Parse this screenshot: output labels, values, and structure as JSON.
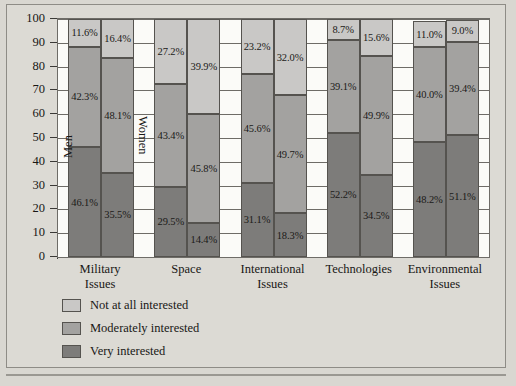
{
  "chart_data": {
    "type": "bar",
    "title": "",
    "subtitle": "",
    "xlabel": "",
    "ylabel": "",
    "ylim": [
      0,
      100
    ],
    "yticks": [
      0,
      10,
      20,
      30,
      40,
      50,
      60,
      70,
      80,
      90,
      100
    ],
    "grid": true,
    "stacked": true,
    "legend_position": "bottom-left",
    "categories": [
      "Military Issues",
      "Space",
      "International Issues",
      "Technologies",
      "Environmental Issues"
    ],
    "category_lines": [
      [
        "Military",
        "Issues"
      ],
      [
        "Space",
        ""
      ],
      [
        "International",
        "Issues"
      ],
      [
        "Technologies",
        ""
      ],
      [
        "Environmental",
        "Issues"
      ]
    ],
    "group_labels": [
      "Men",
      "Women"
    ],
    "stack_order_bottom_to_top": [
      "Very interested",
      "Moderately interested",
      "Not at all interested"
    ],
    "legend": [
      {
        "label": "Not at all interested",
        "color": "#c9c8c6"
      },
      {
        "label": "Moderately interested",
        "color": "#a3a2a0"
      },
      {
        "label": "Very interested",
        "color": "#7d7c7a"
      }
    ],
    "series": [
      {
        "name": "Very interested",
        "color": "#7d7c7a",
        "men": [
          46.1,
          29.5,
          31.1,
          52.2,
          48.2
        ],
        "women": [
          35.5,
          14.4,
          18.3,
          34.5,
          51.1
        ]
      },
      {
        "name": "Moderately interested",
        "color": "#a3a2a0",
        "men": [
          42.3,
          43.4,
          45.6,
          39.1,
          40.0
        ],
        "women": [
          48.1,
          45.8,
          49.7,
          49.9,
          39.4
        ]
      },
      {
        "name": "Not at all interested",
        "color": "#c9c8c6",
        "men": [
          11.6,
          27.2,
          23.2,
          8.7,
          11.0
        ],
        "women": [
          16.4,
          39.9,
          32.0,
          15.6,
          9.0
        ]
      }
    ],
    "data_labels": {
      "Military Issues": {
        "Men": {
          "Very interested": "46.1%",
          "Moderately interested": "42.3%",
          "Not at all interested": "11.6%"
        },
        "Women": {
          "Very interested": "35.5%",
          "Moderately interested": "48.1%",
          "Not at all interested": "16.4%"
        }
      },
      "Space": {
        "Men": {
          "Very interested": "29.5%",
          "Moderately interested": "43.4%",
          "Not at all interested": "27.2%"
        },
        "Women": {
          "Very interested": "14.4%",
          "Moderately interested": "45.8%",
          "Not at all interested": "39.9%"
        }
      },
      "International Issues": {
        "Men": {
          "Very interested": "31.1%",
          "Moderately interested": "45.6%",
          "Not at all interested": "23.2%"
        },
        "Women": {
          "Very interested": "18.3%",
          "Moderately interested": "49.7%",
          "Not at all interested": "32.0%"
        }
      },
      "Technologies": {
        "Men": {
          "Very interested": "52.2%",
          "Moderately interested": "39.1%",
          "Not at all interested": "8.7%"
        },
        "Women": {
          "Very interested": "34.5%",
          "Moderately interested": "49.9%",
          "Not at all interested": "15.6%"
        }
      },
      "Environmental Issues": {
        "Men": {
          "Very interested": "48.2%",
          "Moderately interested": "40.0%",
          "Not at all interested": "11.0%"
        },
        "Women": {
          "Very interested": "51.1%",
          "Moderately interested": "39.4%",
          "Not at all interested": "9.0%"
        }
      }
    }
  },
  "axis": {
    "y_tick_labels": [
      "0",
      "10",
      "20",
      "30",
      "40",
      "50",
      "60",
      "70",
      "80",
      "90",
      "100"
    ]
  },
  "colors": {
    "panel_bg": "#dcdad4",
    "plot_bg": "#fbfbf8",
    "axis": "#3a3936",
    "very": "#7d7c7a",
    "moderate": "#a3a2a0",
    "not_at_all": "#c9c8c6"
  }
}
